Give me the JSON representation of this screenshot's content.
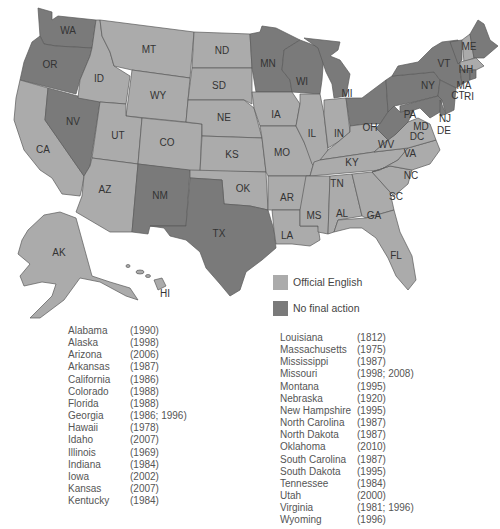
{
  "colors": {
    "official_english": "#ababab",
    "no_final_action": "#7a7a7a",
    "border": "#5a5a5a",
    "background": "#ffffff"
  },
  "map": {
    "states": {
      "WA": {
        "label": "WA",
        "status": "no_final_action"
      },
      "OR": {
        "label": "OR",
        "status": "no_final_action"
      },
      "CA": {
        "label": "CA",
        "status": "official_english"
      },
      "NV": {
        "label": "NV",
        "status": "no_final_action"
      },
      "ID": {
        "label": "ID",
        "status": "official_english"
      },
      "MT": {
        "label": "MT",
        "status": "official_english"
      },
      "WY": {
        "label": "WY",
        "status": "official_english"
      },
      "UT": {
        "label": "UT",
        "status": "official_english"
      },
      "AZ": {
        "label": "AZ",
        "status": "official_english"
      },
      "CO": {
        "label": "CO",
        "status": "official_english"
      },
      "NM": {
        "label": "NM",
        "status": "no_final_action"
      },
      "ND": {
        "label": "ND",
        "status": "official_english"
      },
      "SD": {
        "label": "SD",
        "status": "official_english"
      },
      "NE": {
        "label": "NE",
        "status": "official_english"
      },
      "KS": {
        "label": "KS",
        "status": "official_english"
      },
      "OK": {
        "label": "OK",
        "status": "official_english"
      },
      "TX": {
        "label": "TX",
        "status": "no_final_action"
      },
      "MN": {
        "label": "MN",
        "status": "no_final_action"
      },
      "IA": {
        "label": "IA",
        "status": "official_english"
      },
      "MO": {
        "label": "MO",
        "status": "official_english"
      },
      "AR": {
        "label": "AR",
        "status": "official_english"
      },
      "LA": {
        "label": "LA",
        "status": "official_english"
      },
      "WI": {
        "label": "WI",
        "status": "no_final_action"
      },
      "IL": {
        "label": "IL",
        "status": "official_english"
      },
      "MI": {
        "label": "MI",
        "status": "no_final_action"
      },
      "IN": {
        "label": "IN",
        "status": "official_english"
      },
      "OH": {
        "label": "OH",
        "status": "no_final_action"
      },
      "KY": {
        "label": "KY",
        "status": "official_english"
      },
      "TN": {
        "label": "TN",
        "status": "official_english"
      },
      "MS": {
        "label": "MS",
        "status": "official_english"
      },
      "AL": {
        "label": "AL",
        "status": "official_english"
      },
      "GA": {
        "label": "GA",
        "status": "official_english"
      },
      "FL": {
        "label": "FL",
        "status": "official_english"
      },
      "SC": {
        "label": "SC",
        "status": "official_english"
      },
      "NC": {
        "label": "NC",
        "status": "official_english"
      },
      "VA": {
        "label": "VA",
        "status": "official_english"
      },
      "WV": {
        "label": "WV",
        "status": "no_final_action"
      },
      "PA": {
        "label": "PA",
        "status": "no_final_action"
      },
      "NY": {
        "label": "NY",
        "status": "no_final_action"
      },
      "VT": {
        "label": "VT",
        "status": "no_final_action"
      },
      "NH": {
        "label": "NH",
        "status": "official_english"
      },
      "ME": {
        "label": "ME",
        "status": "no_final_action"
      },
      "MA": {
        "label": "MA",
        "status": "official_english"
      },
      "CT": {
        "label": "CT",
        "status": "no_final_action"
      },
      "RI": {
        "label": "RI",
        "status": "no_final_action"
      },
      "NJ": {
        "label": "NJ",
        "status": "no_final_action"
      },
      "DE": {
        "label": "DE",
        "status": "no_final_action"
      },
      "MD": {
        "label": "MD",
        "status": "no_final_action"
      },
      "DC": {
        "label": "DC",
        "status": "no_final_action"
      },
      "AK": {
        "label": "AK",
        "status": "official_english"
      },
      "HI": {
        "label": "HI",
        "status": "official_english"
      }
    }
  },
  "legend": {
    "items": [
      {
        "label": "Official English",
        "key": "official_english"
      },
      {
        "label": "No final action",
        "key": "no_final_action"
      }
    ]
  },
  "list_left": [
    {
      "state": "Alabama",
      "years": "(1990)"
    },
    {
      "state": "Alaska",
      "years": "(1998)"
    },
    {
      "state": "Arizona",
      "years": "(2006)"
    },
    {
      "state": "Arkansas",
      "years": "(1987)"
    },
    {
      "state": "California",
      "years": "(1986)"
    },
    {
      "state": "Colorado",
      "years": "(1988)"
    },
    {
      "state": "Florida",
      "years": "(1988)"
    },
    {
      "state": "Georgia",
      "years": "(1986; 1996)"
    },
    {
      "state": "Hawaii",
      "years": "(1978)"
    },
    {
      "state": "Idaho",
      "years": "(2007)"
    },
    {
      "state": "Illinois",
      "years": "(1969)"
    },
    {
      "state": "Indiana",
      "years": "(1984)"
    },
    {
      "state": "Iowa",
      "years": "(2002)"
    },
    {
      "state": "Kansas",
      "years": "(2007)"
    },
    {
      "state": "Kentucky",
      "years": "(1984)"
    }
  ],
  "list_right": [
    {
      "state": "Louisiana",
      "years": "(1812)"
    },
    {
      "state": "Massachusetts",
      "years": "(1975)"
    },
    {
      "state": "Mississippi",
      "years": "(1987)"
    },
    {
      "state": "Missouri",
      "years": "(1998; 2008)"
    },
    {
      "state": "Montana",
      "years": "(1995)"
    },
    {
      "state": "Nebraska",
      "years": "(1920)"
    },
    {
      "state": "New Hampshire",
      "years": "(1995)"
    },
    {
      "state": "North Carolina",
      "years": "(1987)"
    },
    {
      "state": "North Dakota",
      "years": "(1987)"
    },
    {
      "state": "Oklahoma",
      "years": "(2010)"
    },
    {
      "state": "South Carolina",
      "years": "(1987)"
    },
    {
      "state": "South Dakota",
      "years": "(1995)"
    },
    {
      "state": "Tennessee",
      "years": "(1984)"
    },
    {
      "state": "Utah",
      "years": "(2000)"
    },
    {
      "state": "Virginia",
      "years": "(1981; 1996)"
    },
    {
      "state": "Wyoming",
      "years": "(1996)"
    }
  ]
}
